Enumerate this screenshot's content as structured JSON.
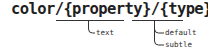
{
  "diagram": {
    "title": "color/{property}/{type}",
    "segments": [
      {
        "name": "property",
        "children": [
          "text"
        ]
      },
      {
        "name": "type",
        "children": [
          "default",
          "subtle"
        ]
      }
    ],
    "colors": {
      "text": "#1f1f1f",
      "line": "#333333",
      "background": "#ffffff"
    }
  }
}
